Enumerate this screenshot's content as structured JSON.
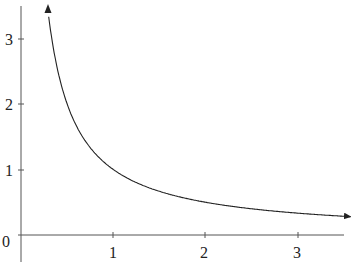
{
  "chart_data": {
    "type": "line",
    "title": "",
    "xlabel": "",
    "ylabel": "",
    "function": "y = 1/x",
    "series": [
      {
        "name": "y = 1/x",
        "x": [
          0.29,
          0.35,
          0.4,
          0.5,
          0.6,
          0.75,
          1,
          1.25,
          1.5,
          2,
          2.5,
          3,
          3.5
        ],
        "y": [
          3.45,
          2.86,
          2.5,
          2.0,
          1.67,
          1.33,
          1.0,
          0.8,
          0.67,
          0.5,
          0.4,
          0.33,
          0.29
        ]
      }
    ],
    "x_ticks": [
      "1",
      "2",
      "3"
    ],
    "y_ticks": [
      "1",
      "2",
      "3"
    ],
    "origin_label": "0",
    "xlim": [
      0,
      3.6
    ],
    "ylim": [
      -0.3,
      3.6
    ],
    "grid": false,
    "legend": null,
    "arrows": [
      "curve-top",
      "curve-right"
    ]
  },
  "labels": {
    "origin": "0",
    "x1": "1",
    "x2": "2",
    "x3": "3",
    "y1": "1",
    "y2": "2",
    "y3": "3"
  }
}
